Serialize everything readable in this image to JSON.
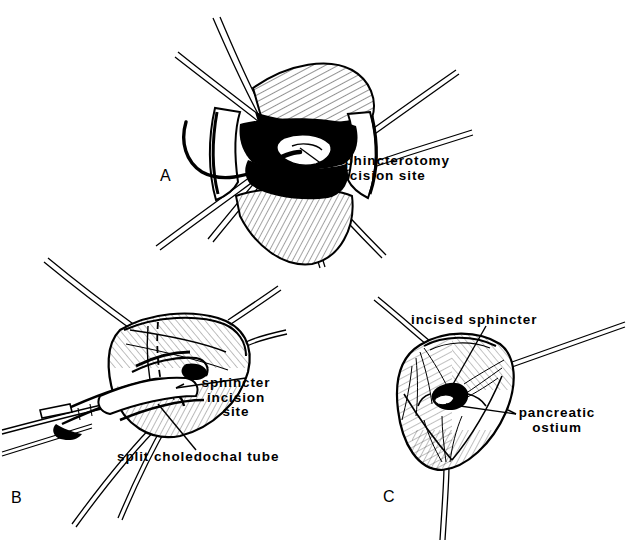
{
  "figure": {
    "background_color": "#ffffff",
    "ink_color": "#000000",
    "style": "pen-and-ink medical line drawing with cross-hatch shading"
  },
  "panels": [
    {
      "id": "A",
      "letter": "A",
      "description": "Duodenum opened with stay sutures retracting the duodenotomy, exposing the ampulla of Vater with a probe in the common bile duct",
      "labels": [
        {
          "name": "sphincterotomy-incision-site",
          "lines": [
            "sphincterotomy",
            "incision site"
          ],
          "align": "left"
        }
      ]
    },
    {
      "id": "B",
      "letter": "B",
      "description": "Ampulla elevated on traction sutures; split choledochal tube in the common duct with dashed line marking the planned sphincter incision",
      "labels": [
        {
          "name": "sphincter-incision-site",
          "lines": [
            "sphincter",
            "incision",
            "site"
          ],
          "align": "center"
        },
        {
          "name": "split-choledochal-tube",
          "lines": [
            "split choledochal tube"
          ],
          "align": "left"
        }
      ]
    },
    {
      "id": "C",
      "letter": "C",
      "description": "Completed sphincteroplasty with three corner sutures; incised sphincter margins everted and pancreatic ostium visible",
      "labels": [
        {
          "name": "incised-sphincter",
          "lines": [
            "incised sphincter"
          ],
          "align": "left"
        },
        {
          "name": "pancreatic-ostium",
          "lines": [
            "pancreatic",
            "ostium"
          ],
          "align": "center"
        }
      ]
    }
  ],
  "letters": {
    "a": "A",
    "b": "B",
    "c": "C"
  },
  "callouts": {
    "sphincterotomy_line1": "sphincterotomy",
    "sphincterotomy_line2": "incision site",
    "sphincter_incision_line1": "sphincter",
    "sphincter_incision_line2": "incision",
    "sphincter_incision_line3": "site",
    "split_choledochal_tube": "split choledochal tube",
    "incised_sphincter": "incised sphincter",
    "pancreatic_ostium_line1": "pancreatic",
    "pancreatic_ostium_line2": "ostium"
  }
}
